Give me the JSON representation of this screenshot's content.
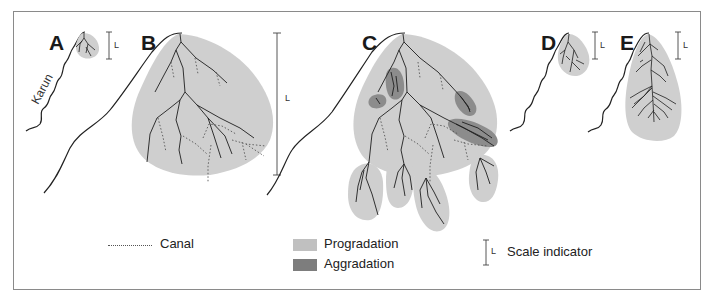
{
  "panels": [
    {
      "id": "A",
      "label": "A",
      "scale_label": "L"
    },
    {
      "id": "B",
      "label": "B",
      "scale_label": "L"
    },
    {
      "id": "C",
      "label": "C"
    },
    {
      "id": "D",
      "label": "D",
      "scale_label": "L"
    },
    {
      "id": "E",
      "label": "E",
      "scale_label": "L"
    }
  ],
  "river": {
    "name": "Karun"
  },
  "legend": {
    "canal": {
      "label": "Canal",
      "style": "dotted-line"
    },
    "progradation": {
      "label": "Progradation",
      "color": "#c8c8c8"
    },
    "aggradation": {
      "label": "Aggradation",
      "color": "#7d7d7d"
    },
    "scale": {
      "label": "Scale indicator",
      "symbol": "L"
    }
  },
  "colors": {
    "frame": "#8a8a8a",
    "lobe_fill": "#cfcfcf",
    "aggradation_fill": "#8c8c8c",
    "channel_stroke": "#1e1e1e"
  }
}
